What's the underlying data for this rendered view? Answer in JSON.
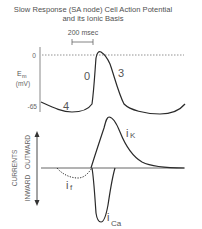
{
  "title": {
    "line1": "Slow Response (SA node) Cell Action Potential",
    "line2": "and its Ionic Basis"
  },
  "scale_bar": {
    "label": "200 msec"
  },
  "membrane_potential": {
    "axis_label": "E",
    "axis_label_subscript": "m",
    "axis_unit": "(mV)",
    "ticks": [
      "0",
      "-65"
    ],
    "phase_labels": [
      "4",
      "0",
      "3"
    ]
  },
  "currents": {
    "axis_title": "CURRENTS",
    "outward_label": "OUTWARD",
    "inward_label": "INWARD",
    "traces": [
      {
        "name": "iK",
        "main": "i",
        "sub": "K",
        "direction": "outward",
        "style": "solid"
      },
      {
        "name": "iCa",
        "main": "i",
        "sub": "Ca",
        "direction": "inward",
        "style": "solid"
      },
      {
        "name": "if",
        "main": "i",
        "sub": "f",
        "direction": "inward",
        "style": "dotted"
      }
    ]
  },
  "colors": {
    "trace": "#2a2a2a",
    "axis": "#888888",
    "text": "#555555"
  }
}
